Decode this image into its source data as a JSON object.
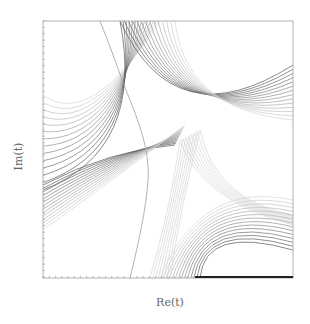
{
  "chart_data": {
    "type": "line",
    "title": "",
    "xlabel": "Re(t)",
    "ylabel": "Im(t)",
    "grid": false,
    "legend": null,
    "tick_labels": false,
    "frame_px": {
      "left": 43,
      "top": 21,
      "right": 293,
      "bottom": 278
    },
    "families": [
      {
        "name": "upper-left family",
        "converges_at": "left edge y~150 and top edge x~140",
        "count": 14
      },
      {
        "name": "upper-right family",
        "converges_at": "top edge x~140 and right edge y~85",
        "count": 14
      },
      {
        "name": "lower-right family",
        "converges_at": "right edge y~245 and bottom edge x~200",
        "count": 14
      },
      {
        "name": "lower-left family",
        "converges_at": "left edge y~220 and bottom edge",
        "count": 14
      }
    ],
    "separatrix": {
      "from_px": [
        100,
        21
      ],
      "to_px": [
        130,
        278
      ]
    }
  },
  "labels": {
    "title": "",
    "xlabel": "Re(t)",
    "ylabel": "Im(t)"
  },
  "colors": {
    "frame": "#b0b0b0",
    "curve_dark": "#555555",
    "curve_light": "#cfcfcf",
    "separatrix": "#a8a8a8"
  }
}
